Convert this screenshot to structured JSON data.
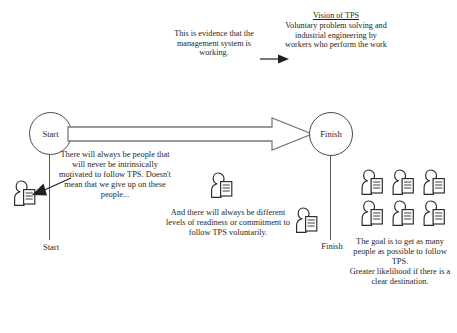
{
  "diagram": {
    "title_block": {
      "vision_title": "Vision of TPS",
      "vision_body": "Voluntary problem solving and industrial engineering by workers who perform the work"
    },
    "evidence_note": "This is evidence that the management system is working.",
    "timeline": {
      "start_node": "Start",
      "finish_node": "Finish",
      "start_axis_label": "Start",
      "finish_axis_label": "Finish"
    },
    "captions": {
      "left": "There will always be people that will never be intrinsically motivated to follow TPS. Doesn't mean that we give up on these people...",
      "middle": "And there will always be different levels of readiness or commitment to follow TPS voluntarily.",
      "right": "The goal is to get as many people as possible to follow TPS.\nGreater likelihood if there is a clear destination."
    },
    "icons": {
      "person": "person-with-document-icon",
      "block_arrow": "block-arrow-icon",
      "evidence_arrow": "arrow-right-icon",
      "pointer_arrow": "arrow-left-pointer-icon"
    },
    "colors": {
      "ink": "#1f1f1f",
      "stroke": "#4a4a4a",
      "background": "#ffffff"
    },
    "people_counts": {
      "left_group": 1,
      "middle_group": 1,
      "finish_group": 1,
      "goal_group": 6
    }
  }
}
